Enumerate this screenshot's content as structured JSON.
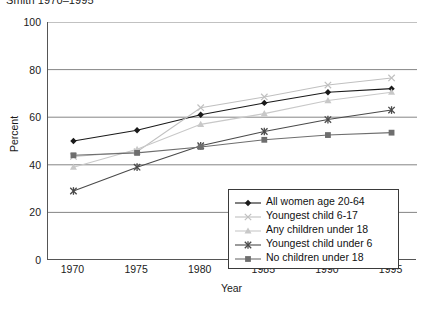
{
  "title_partial": "Smith 1970–1995",
  "axes": {
    "ylabel": "Percent",
    "xlabel": "Year",
    "yticks": [
      "100",
      "80",
      "60",
      "40",
      "20",
      "0"
    ],
    "xticks": [
      "1970",
      "1975",
      "1980",
      "1985",
      "1990",
      "1995"
    ]
  },
  "legend": {
    "items": [
      {
        "label": "All women age 20-64",
        "marker": "diamond-marker",
        "color": "#1a1a1a"
      },
      {
        "label": "Youngest child 6-17",
        "marker": "x-marker",
        "color": "#c0c0c0"
      },
      {
        "label": "Any children under 18",
        "marker": "triangle-marker",
        "color": "#c8c8c8"
      },
      {
        "label": "Youngest child under 6",
        "marker": "asterisk-marker",
        "color": "#4a4a4a"
      },
      {
        "label": "No children under 18",
        "marker": "square-marker",
        "color": "#6e6e6e"
      }
    ]
  },
  "chart_data": {
    "type": "line",
    "title": "Smith 1970–1995",
    "xlabel": "Year",
    "ylabel": "Percent",
    "ylim": [
      0,
      100
    ],
    "xlim": [
      1968,
      1997
    ],
    "grid": true,
    "legend_position": "inside-bottom-right",
    "categories": [
      1970,
      1975,
      1980,
      1985,
      1990,
      1995
    ],
    "series": [
      {
        "name": "All women age 20-64",
        "values": [
          50.0,
          54.5,
          61.0,
          66.0,
          70.5,
          72.0
        ],
        "color": "#1a1a1a",
        "marker": "diamond"
      },
      {
        "name": "Youngest child 6-17",
        "values": [
          43.5,
          45.5,
          64.0,
          68.5,
          73.5,
          76.5
        ],
        "color": "#c0c0c0",
        "marker": "x"
      },
      {
        "name": "Any children under 18",
        "values": [
          39.0,
          46.5,
          57.0,
          61.5,
          67.0,
          70.5
        ],
        "color": "#c8c8c8",
        "marker": "triangle"
      },
      {
        "name": "Youngest child under 6",
        "values": [
          29.0,
          39.0,
          48.0,
          54.0,
          59.0,
          63.0
        ],
        "color": "#4a4a4a",
        "marker": "asterisk"
      },
      {
        "name": "No children under 18",
        "values": [
          44.0,
          45.0,
          47.5,
          50.5,
          52.5,
          53.5
        ],
        "color": "#6e6e6e",
        "marker": "square"
      }
    ]
  }
}
